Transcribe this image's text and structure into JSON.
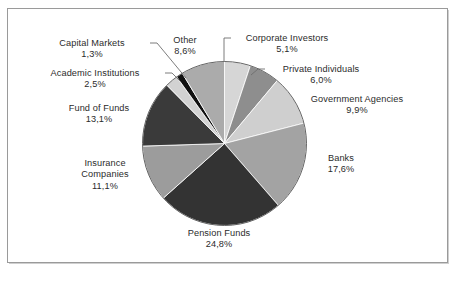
{
  "chart_data": {
    "type": "pie",
    "title": "",
    "subtitle": "",
    "xlabel": "",
    "ylabel": "",
    "legend_position": "none",
    "grid": false,
    "decimal_separator": ",",
    "value_suffix": "%",
    "start_angle_deg": 0,
    "direction": "clockwise",
    "categories": [
      "Corporate Investors",
      "Private Individuals",
      "Government Agencies",
      "Banks",
      "Pension Funds",
      "Insurance Companies",
      "Fund of Funds",
      "Academic Institutions",
      "Capital Markets",
      "Other"
    ],
    "values": [
      5.1,
      6.0,
      9.9,
      17.6,
      24.8,
      11.1,
      13.1,
      2.5,
      1.3,
      8.6
    ],
    "value_labels": [
      "5,1%",
      "6,0%",
      "9,9%",
      "17,6%",
      "24,8%",
      "11,1%",
      "13,1%",
      "2,5%",
      "1,3%",
      "8,6%"
    ],
    "colors": [
      "#d6d6d6",
      "#8e8e8e",
      "#cfcfcf",
      "#a3a3a3",
      "#333333",
      "#9c9c9c",
      "#3a3a3a",
      "#d2d2d2",
      "#111111",
      "#ababab"
    ],
    "slice_border_color": "#ffffff",
    "outline_color": "#555555"
  },
  "slices": {
    "corporate_investors": {
      "name": "Corporate Investors",
      "pct": "5,1%"
    },
    "private_individuals": {
      "name": "Private Individuals",
      "pct": "6,0%"
    },
    "government_agencies": {
      "name": "Government Agencies",
      "pct": "9,9%"
    },
    "banks": {
      "name": "Banks",
      "pct": "17,6%"
    },
    "pension_funds": {
      "name": "Pension Funds",
      "pct": "24,8%"
    },
    "insurance_companies": {
      "name_line1": "Insurance",
      "name_line2": "Companies",
      "pct": "11,1%"
    },
    "fund_of_funds": {
      "name": "Fund of Funds",
      "pct": "13,1%"
    },
    "academic_institutions": {
      "name": "Academic Institutions",
      "pct": "2,5%"
    },
    "capital_markets": {
      "name": "Capital Markets",
      "pct": "1,3%"
    },
    "other": {
      "name": "Other",
      "pct": "8,6%"
    }
  }
}
